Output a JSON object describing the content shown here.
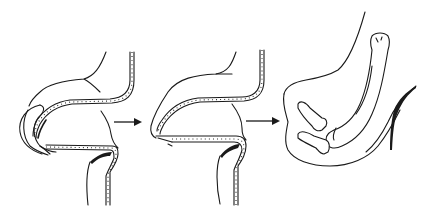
{
  "figure": {
    "type": "three-stage anatomical sequence diagram",
    "background": "#ffffff",
    "ink_color": "#1a1a1a",
    "panels": [
      {
        "id": "stage-1",
        "description": "folded lobe with segmented inner layer",
        "x_range": [
          10,
          120
        ]
      },
      {
        "id": "stage-2",
        "description": "intermediate fused lobe with segmented layer",
        "x_range": [
          145,
          250
        ]
      },
      {
        "id": "stage-3",
        "description": "limb-like structure with long bone and small bones",
        "x_range": [
          280,
          425
        ]
      }
    ],
    "arrows": [
      {
        "id": "arrow-1",
        "from": "stage-1",
        "to": "stage-2",
        "x1": 113,
        "x2": 141,
        "y": 122
      },
      {
        "id": "arrow-2",
        "from": "stage-2",
        "to": "stage-3",
        "x1": 246,
        "x2": 280,
        "y": 121
      }
    ],
    "text_labels": []
  }
}
